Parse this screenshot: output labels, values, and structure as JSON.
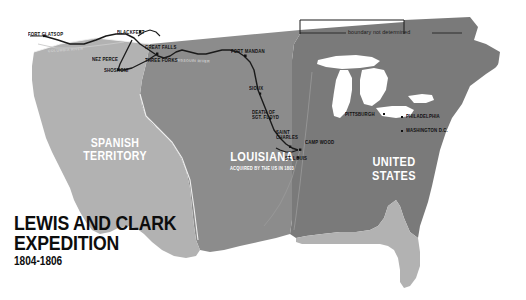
{
  "map": {
    "title_line1": "LEWIS AND CLARK",
    "title_line2": "EXPEDITION",
    "title_dates": "1804-1806",
    "boundary_note": "boundary not determined",
    "colors": {
      "spanish_territory": "#b2b2b2",
      "louisiana": "#8c8c8c",
      "united_states": "#7a7a7a",
      "water": "#ffffff",
      "route": "#1a1a1a",
      "label_dark": "#101010",
      "label_light": "#ffffff"
    },
    "territories": [
      {
        "name": "SPANISH TERRITORY",
        "line1": "SPANISH",
        "line2": "TERRITORY"
      },
      {
        "name": "LOUISIANA",
        "line1": "LOUISIANA",
        "subtitle": "ACQUIRED BY THE US IN 1803"
      },
      {
        "name": "UNITED STATES",
        "line1": "UNITED",
        "line2": "STATES"
      }
    ],
    "places": [
      {
        "label": "FORT CLATSOP"
      },
      {
        "label": "NEZ PERCE"
      },
      {
        "label": "SHOSHONI"
      },
      {
        "label": "BLACKFEET"
      },
      {
        "label": "GREAT FALLS"
      },
      {
        "label": "THREE FORKS"
      },
      {
        "label": "FORT MANDAN"
      },
      {
        "label": "SIOUX"
      },
      {
        "label": "DEATH OF"
      },
      {
        "label": "SGT. FLOYD"
      },
      {
        "label": "SAINT"
      },
      {
        "label": "CHARLES"
      },
      {
        "label": "CAMP WOOD"
      },
      {
        "label": "ST. LOUIS"
      },
      {
        "label": "PITTSBURGH"
      },
      {
        "label": "PHILADELPHIA"
      },
      {
        "label": "WASHINGTON D.C."
      }
    ],
    "rivers": [
      {
        "label": "COLUMBIA RIVER"
      },
      {
        "label": "MISSOURI RIVER"
      },
      {
        "label": "MISSOURI RIVER EAST"
      }
    ]
  }
}
